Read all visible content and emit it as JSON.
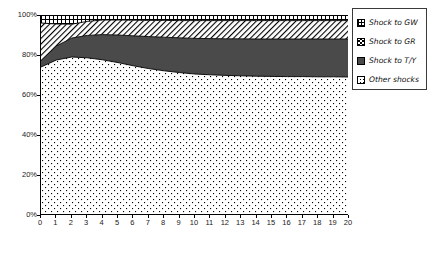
{
  "chart_data": {
    "type": "area",
    "title": "",
    "subtitle": "",
    "xlabel": "",
    "ylabel": "",
    "stacked": true,
    "normalized_percent": true,
    "grid": false,
    "legend_position": "right-top",
    "xlim": [
      0,
      20
    ],
    "ylim": [
      0,
      100
    ],
    "x_tick_labels": [
      "0",
      "1",
      "2",
      "3",
      "4",
      "5",
      "6",
      "7",
      "8",
      "9",
      "10",
      "11",
      "12",
      "13",
      "14",
      "15",
      "16",
      "17",
      "18",
      "19",
      "20"
    ],
    "y_tick_labels": [
      "0%",
      "20%",
      "40%",
      "60%",
      "80%",
      "100%"
    ],
    "y_tick_values": [
      0,
      20,
      40,
      60,
      80,
      100
    ],
    "x": [
      0,
      1,
      2,
      3,
      4,
      5,
      6,
      7,
      8,
      9,
      10,
      11,
      12,
      13,
      14,
      15,
      16,
      17,
      18,
      19,
      20
    ],
    "series": [
      {
        "name": "Other shocks",
        "pattern": "sparse-dots",
        "color": "#ffffff",
        "stack_order": 1,
        "values": [
          74.0,
          77.5,
          79.0,
          78.6,
          77.6,
          76.2,
          74.6,
          73.2,
          72.1,
          71.2,
          70.5,
          70.1,
          69.8,
          69.6,
          69.4,
          69.3,
          69.2,
          69.2,
          69.1,
          69.1,
          69.0
        ]
      },
      {
        "name": "Shock to T/Y",
        "pattern": "solid-dark-gray",
        "color": "#4a4a4a",
        "stack_order": 2,
        "values": [
          3.2,
          7.0,
          9.5,
          11.2,
          12.6,
          13.8,
          15.0,
          16.0,
          16.8,
          17.4,
          17.8,
          18.1,
          18.3,
          18.5,
          18.6,
          18.7,
          18.8,
          18.8,
          18.9,
          18.9,
          19.0
        ]
      },
      {
        "name": "Shock to GR",
        "pattern": "diagonal-hatch",
        "color": "#ffffff",
        "stack_order": 3,
        "values": [
          18.8,
          11.0,
          6.9,
          7.0,
          7.3,
          7.5,
          7.8,
          8.1,
          8.4,
          8.6,
          8.9,
          9.0,
          9.1,
          9.1,
          9.2,
          9.2,
          9.2,
          9.2,
          9.2,
          9.2,
          9.2
        ]
      },
      {
        "name": "Shock to GW",
        "pattern": "cross-hatch-grid",
        "color": "#ffffff",
        "stack_order": 4,
        "values": [
          4.0,
          4.5,
          4.6,
          3.2,
          2.5,
          2.5,
          2.6,
          2.7,
          2.7,
          2.8,
          2.8,
          2.8,
          2.8,
          2.8,
          2.8,
          2.8,
          2.8,
          2.8,
          2.8,
          2.8,
          2.8
        ]
      }
    ],
    "cumulative_boundaries": {
      "other_shocks_top": [
        74.0,
        77.5,
        79.0,
        78.6,
        77.6,
        76.2,
        74.6,
        73.2,
        72.1,
        71.2,
        70.5,
        70.1,
        69.8,
        69.6,
        69.4,
        69.3,
        69.2,
        69.2,
        69.1,
        69.1,
        69.0
      ],
      "shock_to_ty_top": [
        77.2,
        84.5,
        88.5,
        89.8,
        90.2,
        90.0,
        89.6,
        89.2,
        88.9,
        88.6,
        88.3,
        88.2,
        88.1,
        88.1,
        88.0,
        88.0,
        88.0,
        88.0,
        88.0,
        88.0,
        88.0
      ],
      "shock_to_gr_top": [
        96.0,
        95.5,
        95.4,
        96.8,
        97.5,
        97.5,
        97.4,
        97.3,
        97.3,
        97.2,
        97.2,
        97.2,
        97.2,
        97.2,
        97.2,
        97.2,
        97.2,
        97.2,
        97.2,
        97.2,
        97.2
      ],
      "shock_to_gw_top": [
        100,
        100,
        100,
        100,
        100,
        100,
        100,
        100,
        100,
        100,
        100,
        100,
        100,
        100,
        100,
        100,
        100,
        100,
        100,
        100,
        100
      ]
    }
  },
  "legend": {
    "items": [
      {
        "label": "Shock to GW",
        "swatch": "cross-hatch-grid-swatch"
      },
      {
        "label": "Shock to GR",
        "swatch": "diagonal-hatch-swatch"
      },
      {
        "label": "Shock to T/Y",
        "swatch": "solid-dark-gray-swatch"
      },
      {
        "label": "Other shocks",
        "swatch": "sparse-dots-swatch"
      }
    ]
  },
  "axes": {
    "y_labels": [
      "100%",
      "80%",
      "60%",
      "40%",
      "20%",
      "0%"
    ],
    "x_labels": [
      "0",
      "1",
      "2",
      "3",
      "4",
      "5",
      "6",
      "7",
      "8",
      "9",
      "10",
      "11",
      "12",
      "13",
      "14",
      "15",
      "16",
      "17",
      "18",
      "19",
      "20"
    ]
  },
  "colors": {
    "axis": "#000000",
    "ty_fill": "#4a4a4a",
    "plot_background": "#ffffff",
    "legend_border": "#3a3a3a",
    "text": "#1a1a1a"
  }
}
